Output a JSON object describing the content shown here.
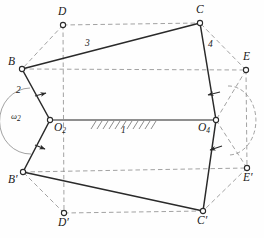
{
  "figure": {
    "type": "four-bar-linkage-kinematic-diagram",
    "width": 264,
    "height": 238,
    "stroke_color": "#2a2a2a",
    "dashed_color": "#8a8a8a",
    "ground_color": "#8f8f8f",
    "background": "#fefefe"
  },
  "joints": {
    "D": {
      "label": "D",
      "x": 63,
      "y": 25,
      "prime": false
    },
    "C": {
      "label": "C",
      "x": 200,
      "y": 23,
      "prime": false
    },
    "B": {
      "label": "B",
      "x": 22,
      "y": 69,
      "prime": false
    },
    "E": {
      "label": "E",
      "x": 246,
      "y": 70,
      "prime": false
    },
    "O2": {
      "label": "O",
      "sub": "2",
      "x": 50,
      "y": 120
    },
    "O4": {
      "label": "O",
      "sub": "4",
      "x": 216,
      "y": 120
    },
    "Bp": {
      "label": "B",
      "x": 23,
      "y": 172,
      "prime": true
    },
    "Ep": {
      "label": "E",
      "x": 247,
      "y": 168,
      "prime": true
    },
    "Dp": {
      "label": "D",
      "x": 64,
      "y": 213,
      "prime": true
    },
    "Cp": {
      "label": "C",
      "x": 203,
      "y": 211,
      "prime": true
    }
  },
  "link_labels": {
    "link1": {
      "text": "1",
      "x": 124,
      "y": 130
    },
    "link2": {
      "text": "2",
      "x": 18,
      "y": 91
    },
    "link3": {
      "text": "3",
      "x": 87,
      "y": 44
    },
    "link4": {
      "text": "4",
      "x": 210,
      "y": 45
    },
    "omega2": {
      "text": "ω",
      "sub": "2",
      "x": 14,
      "y": 114
    }
  },
  "labels": {
    "D": "D",
    "C": "C",
    "B": "B",
    "E": "E",
    "O2_base": "O",
    "O2_sub": "2",
    "O4_base": "O",
    "O4_sub": "4",
    "B_prime": "B′",
    "E_prime": "E′",
    "D_prime": "D′",
    "C_prime": "C′",
    "link1": "1",
    "link2": "2",
    "link3": "3",
    "link4": "4",
    "omega_base": "ω",
    "omega_sub": "2"
  },
  "geometry": {
    "solid_links": [
      {
        "name": "crank-2-upper",
        "from": "O2",
        "to": "B"
      },
      {
        "name": "coupler-3-upper",
        "from": "B",
        "to": "C"
      },
      {
        "name": "rocker-4-upper",
        "from": "C",
        "to": "O4"
      },
      {
        "name": "crank-2-lower",
        "from": "O2",
        "to": "Bp"
      },
      {
        "name": "coupler-3-lower",
        "from": "Bp",
        "to": "Cp"
      },
      {
        "name": "rocker-4-lower",
        "from": "Cp",
        "to": "O4"
      }
    ],
    "ground_link": {
      "name": "ground-link-1",
      "from": "O2",
      "to": "O4"
    },
    "dashed_links": [
      {
        "name": "coupler-point-D-B",
        "from": "D",
        "to": "B"
      },
      {
        "name": "coupler-point-D-C",
        "from": "D",
        "to": "C"
      },
      {
        "name": "rocker-point-E-C",
        "from": "E",
        "to": "C"
      },
      {
        "name": "rocker-point-E-O4",
        "from": "E",
        "to": "O4"
      },
      {
        "name": "coupler-point-Dp-Bp",
        "from": "Dp",
        "to": "Bp"
      },
      {
        "name": "coupler-point-Dp-Cp",
        "from": "Dp",
        "to": "Cp"
      },
      {
        "name": "rocker-point-Ep-Cp",
        "from": "Ep",
        "to": "Cp"
      },
      {
        "name": "rocker-point-Ep-O4",
        "from": "Ep",
        "to": "O4"
      },
      {
        "name": "path-D-to-Dp",
        "from": "D",
        "to": "Dp"
      },
      {
        "name": "path-E-to-Ep",
        "from": "E",
        "to": "Ep"
      }
    ]
  },
  "annotations": {
    "rotation_arrows": [
      {
        "name": "crank-rotation-arrow-upper"
      },
      {
        "name": "crank-rotation-arrow-lower"
      },
      {
        "name": "rocker-rotation-arrow-upper"
      },
      {
        "name": "rocker-rotation-arrow-lower"
      }
    ],
    "arcs": [
      {
        "name": "omega2-sweep-arc"
      },
      {
        "name": "rocker4-sweep-arc"
      }
    ],
    "hatching": {
      "name": "ground-hatching",
      "count": 11
    }
  }
}
